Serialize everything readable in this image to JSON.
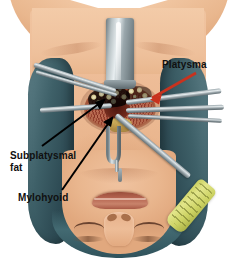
{
  "figure": {
    "type": "medical-illustration",
    "background_color": "#ffffff"
  },
  "labels": [
    {
      "id": "platysma",
      "text": "Platysma",
      "arrow_color": "#c8321e",
      "arrow_direction": "down-left",
      "position": "upper-right"
    },
    {
      "id": "subplatysmal-fat",
      "text": "Subplatysmal fat",
      "line1": "Subplatysmal",
      "line2": "fat",
      "arrow_color": "#000000",
      "arrow_direction": "up-right",
      "position": "mid-left"
    },
    {
      "id": "mylohyoid",
      "text": "Mylohyoid",
      "arrow_color": "#000000",
      "arrow_direction": "up-right",
      "position": "lower-left"
    }
  ],
  "anatomy": {
    "skin_color": "#ecba93",
    "drape_color": "#3e6068",
    "wound_color": "#8c3d2b",
    "fat_color": "#efe7bd",
    "mylohyoid_color": "#c7ab53",
    "parts": [
      "chest",
      "shoulders",
      "neck",
      "submental incision",
      "chin",
      "mouth",
      "nose",
      "eyes"
    ]
  },
  "instruments": [
    {
      "name": "retractor-blade",
      "color": "#9aa7ac",
      "location": "top-center"
    },
    {
      "name": "forceps-left-upper",
      "color": "#9aa7ac",
      "location": "upper-left"
    },
    {
      "name": "retractor-left-mid",
      "color": "#9aa7ac",
      "location": "mid-left"
    },
    {
      "name": "retractor-right-a",
      "color": "#9aa7ac",
      "location": "mid-right"
    },
    {
      "name": "retractor-right-b",
      "color": "#9aa7ac",
      "location": "mid-right"
    },
    {
      "name": "retractor-right-c",
      "color": "#9aa7ac",
      "location": "mid-right"
    },
    {
      "name": "instrument-yellow-handle",
      "color": "#cdd364",
      "location": "lower-right"
    },
    {
      "name": "fork-retractor",
      "color": "#8d999e",
      "location": "below-incision"
    }
  ]
}
